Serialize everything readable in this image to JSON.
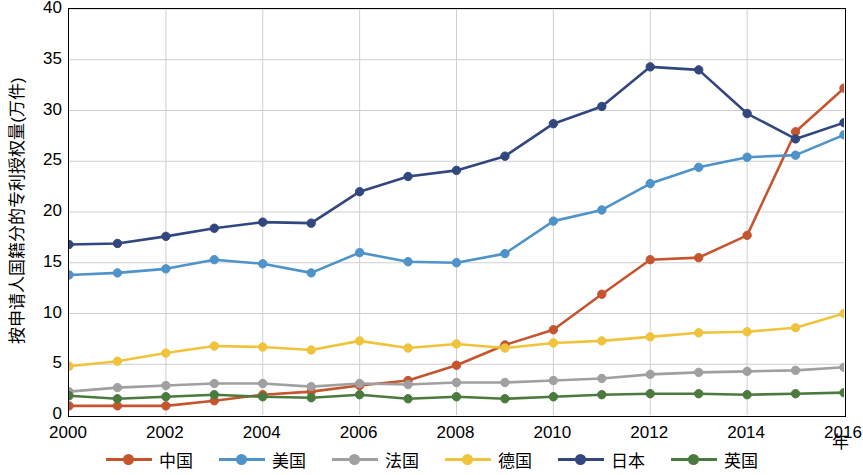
{
  "chart_data": {
    "type": "line",
    "title": "",
    "xlabel": "年",
    "ylabel": "按申请人国籍分的专利授权量(万件)",
    "xlim": [
      2000,
      2016
    ],
    "ylim": [
      0,
      40
    ],
    "ytick_labels": [
      "0",
      "5",
      "10",
      "15",
      "20",
      "25",
      "30",
      "35",
      "40"
    ],
    "yticks": [
      0,
      5,
      10,
      15,
      20,
      25,
      30,
      35,
      40
    ],
    "xtick_labels": [
      "2000",
      "2002",
      "2004",
      "2006",
      "2008",
      "2010",
      "2012",
      "2014",
      "2016"
    ],
    "xticks": [
      2000,
      2002,
      2004,
      2006,
      2008,
      2010,
      2012,
      2014,
      2016
    ],
    "grid": true,
    "legend_position": "bottom",
    "x": [
      2000,
      2001,
      2002,
      2003,
      2004,
      2005,
      2006,
      2007,
      2008,
      2009,
      2010,
      2011,
      2012,
      2013,
      2014,
      2015,
      2016
    ],
    "series": [
      {
        "name": "中国",
        "color": "#C4552F",
        "values": [
          0.9,
          0.9,
          0.9,
          1.4,
          2.0,
          2.3,
          2.9,
          3.4,
          4.9,
          6.9,
          8.4,
          11.9,
          15.3,
          15.5,
          17.7,
          27.9,
          32.2
        ]
      },
      {
        "name": "美国",
        "color": "#4E93C9",
        "values": [
          13.8,
          14.0,
          14.4,
          15.3,
          14.9,
          14.0,
          16.0,
          15.1,
          15.0,
          15.9,
          19.1,
          20.2,
          22.8,
          24.4,
          25.4,
          25.6,
          27.6
        ]
      },
      {
        "name": "法国",
        "color": "#A0A0A0",
        "values": [
          2.3,
          2.7,
          2.9,
          3.1,
          3.1,
          2.8,
          3.1,
          3.0,
          3.2,
          3.2,
          3.4,
          3.6,
          4.0,
          4.2,
          4.3,
          4.4,
          4.7
        ]
      },
      {
        "name": "德国",
        "color": "#F0C33C",
        "values": [
          4.8,
          5.3,
          6.1,
          6.8,
          6.7,
          6.4,
          7.3,
          6.6,
          7.0,
          6.6,
          7.1,
          7.3,
          7.7,
          8.1,
          8.2,
          8.6,
          10.0
        ]
      },
      {
        "name": "日本",
        "color": "#31477E",
        "values": [
          16.8,
          16.9,
          17.6,
          18.4,
          19.0,
          18.9,
          22.0,
          23.5,
          24.1,
          25.5,
          28.7,
          30.4,
          34.3,
          34.0,
          29.7,
          27.2,
          28.8
        ]
      },
      {
        "name": "英国",
        "color": "#4B7A3E",
        "values": [
          1.9,
          1.6,
          1.8,
          2.0,
          1.8,
          1.7,
          2.0,
          1.6,
          1.8,
          1.6,
          1.8,
          2.0,
          2.1,
          2.1,
          2.0,
          2.1,
          2.2
        ]
      }
    ]
  },
  "axis": {
    "y_title": "按申请人国籍分的专利授权量(万件)",
    "x_title": "年"
  }
}
